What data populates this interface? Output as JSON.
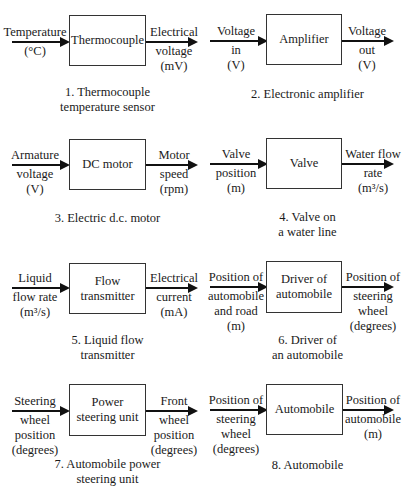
{
  "diagrams": [
    {
      "id": 1,
      "block": "Thermocouple",
      "input_top": "Temperature",
      "input_bottom": "(°C)",
      "output_top": "Electrical",
      "output_bottom": "voltage\n(mV)",
      "caption": "1. Thermocouple\ntemperature sensor"
    },
    {
      "id": 2,
      "block": "Amplifier",
      "input_top": "Voltage",
      "input_bottom": "in\n(V)",
      "output_top": "Voltage",
      "output_bottom": "out\n(V)",
      "caption": "2. Electronic amplifier"
    },
    {
      "id": 3,
      "block": "DC motor",
      "input_top": "Armature",
      "input_bottom": "voltage\n(V)",
      "output_top": "Motor",
      "output_bottom": "speed\n(rpm)",
      "caption": "3. Electric d.c. motor"
    },
    {
      "id": 4,
      "block": "Valve",
      "input_top": "Valve",
      "input_bottom": "position\n(m)",
      "output_top": "Water flow",
      "output_bottom": "rate\n(m³/s)",
      "caption": "4. Valve on\na water line"
    },
    {
      "id": 5,
      "block": "Flow\ntransmitter",
      "input_top": "Liquid",
      "input_bottom": "flow rate\n(m³/s)",
      "output_top": "Electrical",
      "output_bottom": "current\n(mA)",
      "caption": "5. Liquid flow\ntransmitter"
    },
    {
      "id": 6,
      "block": "Driver of\nautomobile",
      "input_top": "Position of",
      "input_bottom": "automobile\nand road\n(m)",
      "output_top": "Position of",
      "output_bottom": "steering\nwheel\n(degrees)",
      "caption": "6. Driver of\nan automobile"
    },
    {
      "id": 7,
      "block": "Power\nsteering unit",
      "input_top": "Steering",
      "input_bottom": "wheel\nposition\n(degrees)",
      "output_top": "Front",
      "output_bottom": "wheel\nposition\n(degrees)",
      "caption": "7. Automobile power\nsteering unit"
    },
    {
      "id": 8,
      "block": "Automobile",
      "input_top": "Position of",
      "input_bottom": "steering\nwheel\n(degrees)",
      "output_top": "Position of",
      "output_bottom": "automobile\n(m)",
      "caption": "8. Automobile"
    }
  ]
}
